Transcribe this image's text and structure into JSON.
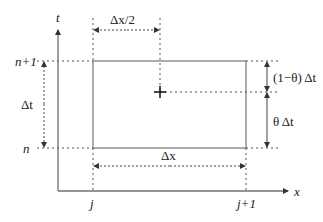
{
  "diagram": {
    "axes": {
      "vertical_label": "t",
      "horizontal_label": "x"
    },
    "ticks": {
      "time_upper": "n+1",
      "time_lower": "n",
      "space_left": "j",
      "space_right": "j+1"
    },
    "dimensions": {
      "half_dx": "Δx/2",
      "dx": "Δx",
      "dt": "Δt",
      "one_minus_theta_dt": "(1−θ) Δt",
      "theta_dt": "θ Δt"
    },
    "marker": "+",
    "colors": {
      "axis": "#707070",
      "cell": "#808080",
      "dashed": "#505050",
      "text": "#222222"
    }
  }
}
